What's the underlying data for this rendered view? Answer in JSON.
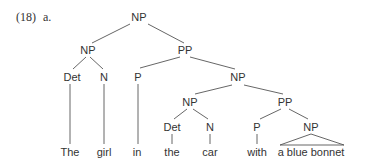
{
  "example": {
    "number": "(18)",
    "sub_label": "a."
  },
  "tree": {
    "nodes": [
      {
        "id": "np0",
        "label": "NP",
        "x": 139,
        "y": 21
      },
      {
        "id": "np1",
        "label": "NP",
        "x": 88,
        "y": 54
      },
      {
        "id": "pp1",
        "label": "PP",
        "x": 185,
        "y": 54
      },
      {
        "id": "det1",
        "label": "Det",
        "x": 72,
        "y": 81
      },
      {
        "id": "n1",
        "label": "N",
        "x": 104,
        "y": 81
      },
      {
        "id": "p1",
        "label": "P",
        "x": 138,
        "y": 81
      },
      {
        "id": "np2",
        "label": "NP",
        "x": 238,
        "y": 81
      },
      {
        "id": "np3",
        "label": "NP",
        "x": 190,
        "y": 106
      },
      {
        "id": "pp2",
        "label": "PP",
        "x": 285,
        "y": 106
      },
      {
        "id": "det2",
        "label": "Det",
        "x": 172,
        "y": 131
      },
      {
        "id": "n2",
        "label": "N",
        "x": 210,
        "y": 131
      },
      {
        "id": "p2",
        "label": "P",
        "x": 257,
        "y": 131
      },
      {
        "id": "np4",
        "label": "NP",
        "x": 311,
        "y": 131
      },
      {
        "id": "w1",
        "label": "The",
        "x": 70,
        "y": 156
      },
      {
        "id": "w2",
        "label": "girl",
        "x": 104,
        "y": 156
      },
      {
        "id": "w3",
        "label": "in",
        "x": 137,
        "y": 156
      },
      {
        "id": "w4",
        "label": "the",
        "x": 172,
        "y": 156
      },
      {
        "id": "w5",
        "label": "car",
        "x": 210,
        "y": 156
      },
      {
        "id": "w6",
        "label": "with",
        "x": 257,
        "y": 156
      },
      {
        "id": "w7",
        "label": "a blue bonnet",
        "x": 311,
        "y": 156
      }
    ],
    "edges": [
      {
        "from": "np0",
        "to": "np1",
        "x1": 130,
        "y1": 24,
        "x2": 92,
        "y2": 43
      },
      {
        "from": "np0",
        "to": "pp1",
        "x1": 148,
        "y1": 24,
        "x2": 184,
        "y2": 43
      },
      {
        "from": "np1",
        "to": "det1",
        "x1": 86,
        "y1": 57,
        "x2": 73,
        "y2": 69
      },
      {
        "from": "np1",
        "to": "n1",
        "x1": 90,
        "y1": 57,
        "x2": 103,
        "y2": 69
      },
      {
        "from": "pp1",
        "to": "p1",
        "x1": 180,
        "y1": 57,
        "x2": 140,
        "y2": 68
      },
      {
        "from": "pp1",
        "to": "np2",
        "x1": 190,
        "y1": 57,
        "x2": 235,
        "y2": 69
      },
      {
        "from": "np2",
        "to": "np3",
        "x1": 232,
        "y1": 85,
        "x2": 195,
        "y2": 94
      },
      {
        "from": "np2",
        "to": "pp2",
        "x1": 244,
        "y1": 85,
        "x2": 283,
        "y2": 94
      },
      {
        "from": "np3",
        "to": "det2",
        "x1": 187,
        "y1": 109,
        "x2": 174,
        "y2": 119
      },
      {
        "from": "np3",
        "to": "n2",
        "x1": 193,
        "y1": 109,
        "x2": 208,
        "y2": 119
      },
      {
        "from": "pp2",
        "to": "p2",
        "x1": 281,
        "y1": 109,
        "x2": 260,
        "y2": 119
      },
      {
        "from": "pp2",
        "to": "np4",
        "x1": 289,
        "y1": 109,
        "x2": 308,
        "y2": 119
      },
      {
        "from": "det1",
        "to": "w1",
        "x1": 70,
        "y1": 84,
        "x2": 70,
        "y2": 144
      },
      {
        "from": "n1",
        "to": "w2",
        "x1": 104,
        "y1": 84,
        "x2": 104,
        "y2": 144
      },
      {
        "from": "p1",
        "to": "w3",
        "x1": 138,
        "y1": 84,
        "x2": 138,
        "y2": 144
      },
      {
        "from": "det2",
        "to": "w4",
        "x1": 172,
        "y1": 134,
        "x2": 172,
        "y2": 144
      },
      {
        "from": "n2",
        "to": "w5",
        "x1": 210,
        "y1": 134,
        "x2": 210,
        "y2": 144
      },
      {
        "from": "p2",
        "to": "w6",
        "x1": 257,
        "y1": 134,
        "x2": 257,
        "y2": 144
      }
    ],
    "triangle": {
      "from": "np4",
      "to": "w7",
      "apex_x": 311,
      "apex_y": 134,
      "left_x": 280,
      "right_x": 344,
      "base_y": 145
    }
  }
}
